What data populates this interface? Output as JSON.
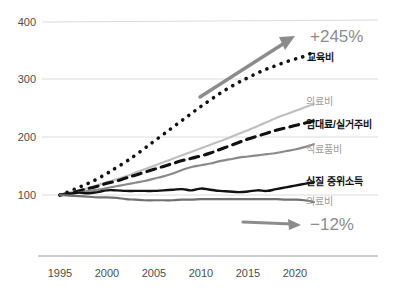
{
  "chart_data": {
    "type": "line",
    "title": "",
    "subtitle": "",
    "xlabel": "",
    "ylabel": "",
    "index_base": 100,
    "x": [
      1995,
      1996,
      1997,
      1998,
      1999,
      2000,
      2001,
      2002,
      2003,
      2004,
      2005,
      2006,
      2007,
      2008,
      2009,
      2010,
      2011,
      2012,
      2013,
      2014,
      2015,
      2016,
      2017,
      2018,
      2019,
      2020,
      2021,
      2022
    ],
    "xlim": [
      1995,
      2022
    ],
    "ylim": [
      70,
      400
    ],
    "grid": true,
    "gridlines": [
      100,
      200,
      300,
      400
    ],
    "xticks": [
      "1995",
      "2000",
      "2005",
      "2010",
      "2015",
      "2020"
    ],
    "xtick_values": [
      1995,
      2000,
      2005,
      2010,
      2015,
      2020
    ],
    "yticks": [
      "100",
      "200",
      "300",
      "400"
    ],
    "ytick_values": [
      100,
      200,
      300,
      400
    ],
    "legend_position": "right-inline",
    "series": [
      {
        "name": "교육비",
        "style": "dotted",
        "color": "#111111",
        "label_weight": "bold",
        "label_color": "#111111",
        "label_y_value": 334,
        "values": [
          100,
          106,
          113,
          120,
          128,
          137,
          147,
          157,
          168,
          180,
          192,
          204,
          216,
          228,
          240,
          252,
          263,
          274,
          284,
          293,
          301,
          309,
          316,
          322,
          328,
          333,
          338,
          345
        ]
      },
      {
        "name": "의료비",
        "style": "solid",
        "color": "#bfbfbf",
        "label_weight": "normal",
        "label_color": "#9b9b9b",
        "label_y_value": 255,
        "values": [
          100,
          104,
          108,
          112,
          117,
          122,
          127,
          132,
          138,
          144,
          150,
          156,
          162,
          168,
          174,
          180,
          186,
          192,
          198,
          205,
          211,
          218,
          225,
          232,
          238,
          244,
          250,
          256
        ]
      },
      {
        "name": "임대료/실거주비",
        "style": "dashed",
        "color": "#111111",
        "label_weight": "bold",
        "label_color": "#111111",
        "label_y_value": 225,
        "values": [
          100,
          103,
          107,
          111,
          115,
          120,
          124,
          129,
          134,
          139,
          144,
          149,
          154,
          159,
          163,
          167,
          172,
          178,
          184,
          190,
          196,
          201,
          206,
          211,
          215,
          219,
          223,
          227
        ]
      },
      {
        "name": "식료품비",
        "style": "solid",
        "color": "#8a8a8a",
        "label_weight": "normal",
        "label_color": "#9b9b9b",
        "label_y_value": 185,
        "values": [
          100,
          102,
          104,
          107,
          109,
          112,
          115,
          118,
          121,
          124,
          128,
          132,
          137,
          143,
          148,
          151,
          154,
          158,
          161,
          164,
          166,
          168,
          170,
          172,
          175,
          178,
          182,
          187
        ]
      },
      {
        "name": "실질 중위소득",
        "style": "solid",
        "color": "#111111",
        "label_weight": "bold",
        "label_color": "#111111",
        "label_y_value": 122,
        "values": [
          100,
          102,
          104,
          103,
          105,
          108,
          108,
          107,
          107,
          107,
          107,
          108,
          109,
          110,
          108,
          111,
          109,
          107,
          106,
          105,
          106,
          108,
          107,
          110,
          113,
          116,
          119,
          122
        ]
      },
      {
        "name": "의료비",
        "style": "solid",
        "color": "#707070",
        "label_weight": "normal",
        "label_color": "#9b9b9b",
        "label_y_value": 88,
        "values": [
          100,
          99,
          98,
          97,
          96,
          96,
          95,
          93,
          92,
          91,
          91,
          91,
          91,
          92,
          92,
          93,
          93,
          93,
          93,
          93,
          93,
          93,
          93,
          93,
          92,
          92,
          91,
          88
        ]
      }
    ],
    "annotations": [
      {
        "id": "growth-annotation",
        "text": "+245%",
        "color": "#8c8c8c",
        "arrow": "up-right"
      },
      {
        "id": "decline-annotation",
        "text": "−12%",
        "color": "#8c8c8c",
        "arrow": "right"
      }
    ]
  }
}
